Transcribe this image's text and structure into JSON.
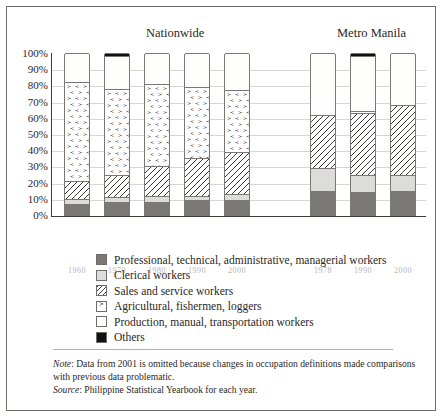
{
  "panels": {
    "nationwide_title": "Nationwide",
    "metro_title": "Metro Manila"
  },
  "legend": [
    {
      "key": "prof",
      "label": "Professional, technical, administrative, managerial workers",
      "swatch": "dark-gray-solid",
      "color": "#7b7977"
    },
    {
      "key": "cler",
      "label": "Clerical workers",
      "swatch": "light-gray-solid",
      "color": "#dcdcda"
    },
    {
      "key": "sales",
      "label": "Sales and service workers",
      "swatch": "diagonal-hatch",
      "color": "#3f3d3b"
    },
    {
      "key": "agri",
      "label": "Agricultural, fishermen, loggers",
      "swatch": "chevron-dot",
      "color": "#3f3d3b"
    },
    {
      "key": "prod",
      "label": "Production, manual, transportation workers",
      "swatch": "white-empty",
      "color": "#ffffff"
    },
    {
      "key": "oth",
      "label": "Others",
      "swatch": "black-solid",
      "color": "#111111"
    }
  ],
  "notes": {
    "note_label": "Note",
    "note_text_1": ": Data from 2001 is omitted because changes in occupation definitions made comparisons",
    "note_text_2": "with previous data problematic.",
    "source_label": "Source",
    "source_text": ": Philippine Statistical Yearbook for each year."
  },
  "chart_data": {
    "type": "bar",
    "subtype": "stacked-percentage",
    "title": "",
    "xlabel": "",
    "ylabel": "",
    "ylim": [
      0,
      100
    ],
    "grid": true,
    "legend_position": "below",
    "ytick_labels": [
      "100%",
      "90%",
      "80%",
      "70%",
      "60%",
      "50%",
      "40%",
      "30%",
      "20%",
      "10%",
      "0%"
    ],
    "ytick_values": [
      100,
      90,
      80,
      70,
      60,
      50,
      40,
      30,
      20,
      10,
      0
    ],
    "groups": [
      {
        "name": "Nationwide",
        "categories": [
          "1960",
          "1970",
          "1980",
          "1990",
          "2000"
        ],
        "series": [
          {
            "name": "Professional, technical, administrative, managerial workers",
            "key": "prof",
            "values": [
              7,
              8,
              8,
              9,
              9
            ]
          },
          {
            "name": "Clerical workers",
            "key": "cler",
            "values": [
              3,
              3,
              4,
              3,
              4
            ]
          },
          {
            "name": "Sales and service workers",
            "key": "sales",
            "values": [
              11,
              14,
              18,
              23,
              26
            ]
          },
          {
            "name": "Agricultural, fishermen, loggers",
            "key": "agri",
            "values": [
              61,
              53,
              51,
              44,
              38
            ]
          },
          {
            "name": "Production, manual, transportation workers",
            "key": "prod",
            "values": [
              18,
              20,
              19,
              21,
              23
            ]
          },
          {
            "name": "Others",
            "key": "oth",
            "values": [
              0,
              2,
              0,
              0,
              0
            ]
          }
        ]
      },
      {
        "name": "Metro Manila",
        "categories": [
          "1978",
          "1990",
          "2000"
        ],
        "series": [
          {
            "name": "Professional, technical, administrative, managerial workers",
            "key": "prof",
            "values": [
              15,
              14,
              15
            ]
          },
          {
            "name": "Clerical workers",
            "key": "cler",
            "values": [
              14,
              11,
              10
            ]
          },
          {
            "name": "Sales and service workers",
            "key": "sales",
            "values": [
              33,
              38,
              43
            ]
          },
          {
            "name": "Agricultural, fishermen, loggers",
            "key": "agri",
            "values": [
              0,
              1,
              0
            ]
          },
          {
            "name": "Production, manual, transportation workers",
            "key": "prod",
            "values": [
              38,
              34,
              32
            ]
          },
          {
            "name": "Others",
            "key": "oth",
            "values": [
              0,
              2,
              0
            ]
          }
        ]
      }
    ]
  }
}
